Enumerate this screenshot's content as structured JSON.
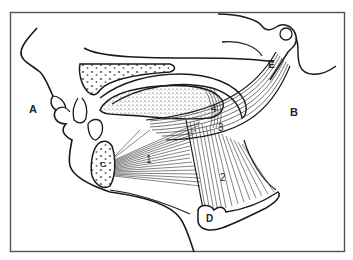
{
  "diagram": {
    "type": "anatomical-line-drawing",
    "colors": {
      "ink": "#1a1a1a",
      "frame": "#555555",
      "background": "#ffffff",
      "stipple": "#444444"
    },
    "letter_labels": [
      {
        "id": "A",
        "text": "A",
        "x": 29,
        "y": 113
      },
      {
        "id": "B",
        "text": "B",
        "x": 290,
        "y": 116
      },
      {
        "id": "C",
        "text": "C",
        "x": 100,
        "y": 167
      },
      {
        "id": "D",
        "text": "D",
        "x": 210,
        "y": 220
      },
      {
        "id": "E",
        "text": "E",
        "x": 270,
        "y": 67
      }
    ],
    "number_labels": [
      {
        "id": "1",
        "text": "1",
        "x": 146,
        "y": 163
      },
      {
        "id": "2",
        "text": "2",
        "x": 222,
        "y": 181
      },
      {
        "id": "3",
        "text": "3",
        "x": 220,
        "y": 131
      },
      {
        "id": "4",
        "text": "4",
        "x": 213,
        "y": 112
      }
    ]
  }
}
